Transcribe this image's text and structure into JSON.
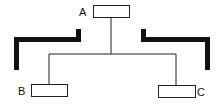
{
  "diagram": {
    "type": "tree",
    "nodes": [
      {
        "id": "A",
        "label": "A",
        "role": "root"
      },
      {
        "id": "B",
        "label": "B",
        "role": "child"
      },
      {
        "id": "C",
        "label": "C",
        "role": "child"
      }
    ],
    "edges": [
      {
        "from": "A",
        "to": "B"
      },
      {
        "from": "A",
        "to": "C"
      }
    ],
    "colors": {
      "line": "#222222",
      "bracket": "#111111",
      "box_fill": "#ffffff"
    }
  }
}
